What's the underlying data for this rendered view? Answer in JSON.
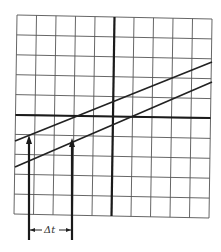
{
  "diagram": {
    "type": "oscilloscope-grid",
    "grid": {
      "columns": 10,
      "rows": 10
    },
    "axes": {
      "vertical_axis_column": 5,
      "horizontal_axis_row": 5
    },
    "curves": [
      {
        "name": "upper-trace",
        "description": "rising line crossing horizontal axis left of center"
      },
      {
        "name": "lower-trace",
        "description": "rising line crossing horizontal axis at center"
      }
    ],
    "arrows": [
      {
        "name": "arrow-left",
        "points_to": "upper-trace at horizontal axis crossing level"
      },
      {
        "name": "arrow-right",
        "points_to": "lower-trace at same level"
      }
    ],
    "dimension_label": "Δt",
    "colors": {
      "line": "#222222",
      "grid": "#555555",
      "background": "#ffffff"
    }
  }
}
